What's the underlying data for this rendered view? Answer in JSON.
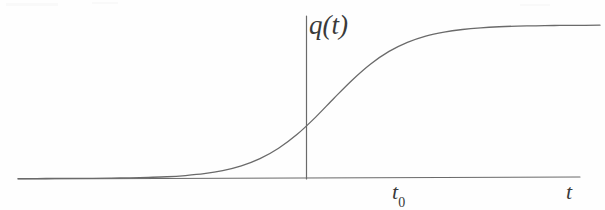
{
  "figure": {
    "kind": "line-plot",
    "background_color": "#fefefe",
    "ink_color": "#6a6a6a",
    "label_color": "#3a3a3a",
    "y_axis_label": "q(t)",
    "x_axis_label": "t",
    "x_tick_label_base": "t",
    "x_tick_label_sub": "0"
  },
  "chart_data": {
    "type": "line",
    "title": "",
    "xlabel": "t",
    "ylabel": "q(t)",
    "legend": [],
    "grid": false,
    "annotations": [
      {
        "name": "origin-tick",
        "label": "t₀",
        "x": 0,
        "note": "step centre on time axis"
      },
      {
        "name": "y-axis-label",
        "label": "q(t)",
        "note": "vertical axis at t = 0 reference"
      },
      {
        "name": "x-axis-label",
        "label": "t",
        "note": "time axis, right end"
      }
    ],
    "xlim": [
      -6.2,
      6.4
    ],
    "ylim": [
      -0.08,
      1.16
    ],
    "series": [
      {
        "name": "q(t)",
        "description": "smooth logistic step rising from 0 to 1 centred at t0",
        "x": [
          -6.2,
          -5.8,
          -5.4,
          -5.0,
          -4.6,
          -4.2,
          -3.8,
          -3.4,
          -3.0,
          -2.6,
          -2.2,
          -1.8,
          -1.4,
          -1.0,
          -0.6,
          -0.2,
          0.2,
          0.6,
          1.0,
          1.4,
          1.8,
          2.2,
          2.6,
          3.0,
          3.4,
          3.8,
          4.2,
          4.6,
          5.0,
          5.4,
          5.8,
          6.4
        ],
        "y": [
          0.0,
          0.0,
          0.001,
          0.001,
          0.002,
          0.003,
          0.005,
          0.008,
          0.012,
          0.02,
          0.032,
          0.052,
          0.083,
          0.13,
          0.198,
          0.289,
          0.401,
          0.524,
          0.643,
          0.747,
          0.829,
          0.888,
          0.929,
          0.955,
          0.972,
          0.983,
          0.99,
          0.994,
          0.996,
          0.998,
          0.999,
          1.0
        ]
      }
    ]
  }
}
